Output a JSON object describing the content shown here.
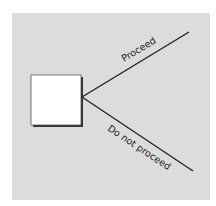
{
  "diagram": {
    "type": "decision-tree",
    "background_color": "#dcdcdc",
    "node": {
      "shape": "square",
      "role": "decision-node",
      "fill": "#ffffff"
    },
    "branches": [
      {
        "label": "Proceed",
        "direction": "up-right"
      },
      {
        "label": "Do not proceed",
        "direction": "down-right"
      }
    ]
  }
}
